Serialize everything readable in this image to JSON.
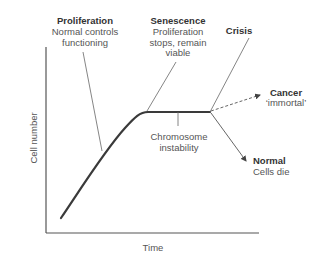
{
  "diagram": {
    "axes": {
      "x_label": "Time",
      "y_label": "Cell number"
    },
    "annotations": {
      "proliferation": {
        "title": "Proliferation",
        "line1": "Normal controls",
        "line2": "functioning"
      },
      "senescence": {
        "title": "Senescence",
        "line1": "Proliferation",
        "line2": "stops, remain",
        "line3": "viable"
      },
      "crisis": {
        "title": "Crisis"
      },
      "chromosome": {
        "line1": "Chromosome",
        "line2": "instability"
      },
      "cancer": {
        "title": "Cancer",
        "subtitle": "‘immortal’"
      },
      "normal": {
        "title": "Normal",
        "subtitle": "Cells die"
      }
    },
    "colors": {
      "curve": "#3a3a3a",
      "axis": "#555555",
      "leader": "#666666",
      "text": "#555555",
      "title_text": "#333333"
    }
  }
}
